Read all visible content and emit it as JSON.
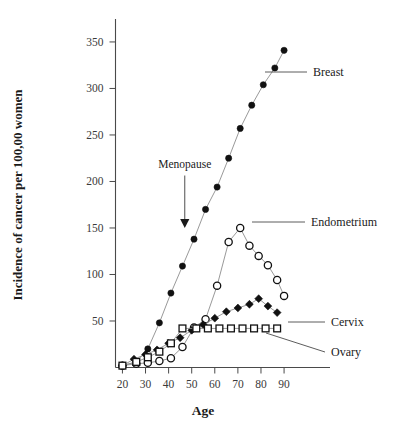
{
  "chart_data": {
    "type": "line",
    "title": "",
    "xlabel": "Age",
    "ylabel": "Incidence of cancer per 100,00 women",
    "xlim": [
      17,
      93
    ],
    "ylim": [
      0,
      365
    ],
    "xticks": [
      20,
      30,
      40,
      50,
      60,
      70,
      80,
      90
    ],
    "yticks": [
      50,
      100,
      150,
      200,
      250,
      300,
      350
    ],
    "grid": false,
    "legend_position": "right-inline-labels",
    "annotations": [
      {
        "text": "Menopause",
        "x": 47,
        "y": 215,
        "arrow": "down",
        "arrow_to_y": 150
      }
    ],
    "series": [
      {
        "name": "Breast",
        "marker": "filled-circle",
        "label_anchor": {
          "x": 93,
          "y": 292
        },
        "x": [
          20,
          26,
          31,
          36,
          41,
          46,
          51,
          56,
          61,
          66,
          71,
          76,
          81,
          86,
          90
        ],
        "values": [
          2,
          6,
          20,
          48,
          80,
          109,
          138,
          170,
          194,
          225,
          257,
          282,
          304,
          322,
          341
        ]
      },
      {
        "name": "Endometrium",
        "marker": "open-circle",
        "label_anchor": {
          "x": 94,
          "y": 152
        },
        "x": [
          20,
          26,
          31,
          36,
          41,
          46,
          51,
          56,
          61,
          66,
          71,
          75,
          79,
          83,
          87,
          90
        ],
        "values": [
          2,
          4,
          5,
          7,
          10,
          22,
          43,
          52,
          88,
          135,
          150,
          131,
          120,
          110,
          94,
          77
        ]
      },
      {
        "name": "Cervix",
        "marker": "filled-diamond",
        "label_anchor": {
          "x": 94,
          "y": 52
        },
        "x": [
          20,
          25,
          30,
          35,
          40,
          45,
          50,
          55,
          60,
          65,
          70,
          75,
          79,
          83,
          87
        ],
        "values": [
          2,
          9,
          14,
          19,
          26,
          32,
          40,
          46,
          53,
          60,
          64,
          68,
          74,
          66,
          59
        ]
      },
      {
        "name": "Ovary",
        "marker": "open-square",
        "label_anchor": {
          "x": 94,
          "y": 22
        },
        "x": [
          20,
          26,
          31,
          36,
          41,
          46,
          52,
          57,
          62,
          67,
          72,
          77,
          82,
          87
        ],
        "values": [
          2,
          6,
          11,
          17,
          26,
          42,
          42,
          42,
          42,
          42,
          42,
          42,
          42,
          42
        ]
      }
    ]
  },
  "labels": {
    "breast": "Breast",
    "endometrium": "Endometrium",
    "cervix": "Cervix",
    "ovary": "Ovary",
    "menopause": "Menopause",
    "age": "Age",
    "incidence": "Incidence of cancer per 100,00 women"
  }
}
